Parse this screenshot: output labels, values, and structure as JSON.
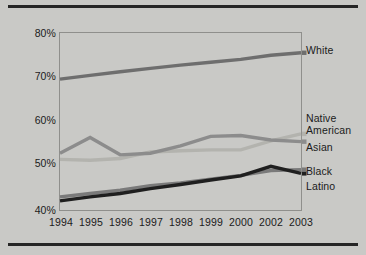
{
  "figure": {
    "background_color": "#c9c9c6",
    "frame_color": "#8f8f8c",
    "rule_color": "#262626"
  },
  "chart_data": {
    "type": "line",
    "title": "",
    "subtitle": "",
    "xlabel": "",
    "ylabel": "",
    "grid": false,
    "legend_position": "right-inline",
    "categories": [
      "1994",
      "1995",
      "1996",
      "1997",
      "1998",
      "1999",
      "2000",
      "2002",
      "2003"
    ],
    "x_tick_labels": [
      "1994",
      "1995",
      "1996",
      "1997",
      "1998",
      "1999",
      "2000",
      "2002",
      "2003"
    ],
    "y_tick_labels": [
      "80%",
      "70%",
      "60%",
      "50%",
      "40%"
    ],
    "y_tick_values": [
      80,
      70,
      60,
      50,
      40
    ],
    "ylim": [
      38,
      81
    ],
    "y_axis_unit": "%",
    "series": [
      {
        "name": "White",
        "color": "#6e6e6e",
        "values": [
          69.8,
          70.7,
          71.6,
          72.4,
          73.2,
          73.9,
          74.6,
          75.6,
          76.2
        ]
      },
      {
        "name": "Native American",
        "color": "#8c8c8c",
        "values": [
          51.8,
          55.6,
          51.4,
          51.8,
          53.6,
          55.9,
          56.1,
          55.0,
          54.6
        ]
      },
      {
        "name": "Asian",
        "color": "#b3b3ae",
        "values": [
          50.3,
          50.1,
          50.5,
          52.1,
          52.4,
          52.6,
          52.6,
          54.8,
          56.5
        ]
      },
      {
        "name": "Black",
        "color": "#1f1f1f",
        "values": [
          40.2,
          41.2,
          42.0,
          43.2,
          44.2,
          45.3,
          46.3,
          48.6,
          46.9
        ]
      },
      {
        "name": "Latino",
        "color": "#7a7a7a",
        "values": [
          41.2,
          42.0,
          42.8,
          43.9,
          44.6,
          45.5,
          46.4,
          47.6,
          47.8
        ]
      }
    ],
    "legend_entries": [
      {
        "label": "White"
      },
      {
        "label": "Native",
        "label2": "American"
      },
      {
        "label": "Asian"
      },
      {
        "label": "Black"
      },
      {
        "label": "Latino"
      }
    ]
  },
  "legend": {
    "white": "White",
    "native_line1": "Native",
    "native_line2": "American",
    "asian": "Asian",
    "black": "Black",
    "latino": "Latino"
  },
  "yaxis": {
    "t80": "80%",
    "t70": "70%",
    "t60": "60%",
    "t50": "50%",
    "t40": "40%"
  },
  "xaxis": {
    "y1994": "1994",
    "y1995": "1995",
    "y1996": "1996",
    "y1997": "1997",
    "y1998": "1998",
    "y1999": "1999",
    "y2000": "2000",
    "y2002": "2002",
    "y2003": "2003"
  }
}
